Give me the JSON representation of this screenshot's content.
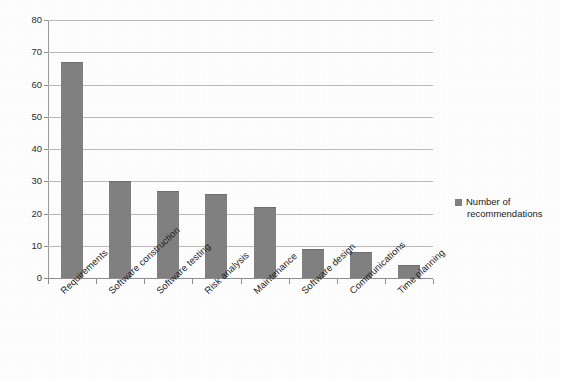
{
  "document": {
    "cut_off_header_text": "....... ... .. .. ......... .. ..... ......... ...."
  },
  "legend": {
    "marker_color": "#808080",
    "label_line1": "Number of",
    "label_line2": "recommendations"
  },
  "axes": {
    "y_ticks": [
      "80",
      "70",
      "60",
      "50",
      "40",
      "30",
      "20",
      "10",
      "0"
    ]
  },
  "chart_data": {
    "type": "bar",
    "title": "",
    "xlabel": "",
    "ylabel": "",
    "ylim": [
      0,
      80
    ],
    "ytick_step": 10,
    "grid": true,
    "legend_position": "right",
    "bar_color": "#808080",
    "categories": [
      "Requirements",
      "Software construction",
      "Software testing",
      "Risk analysis",
      "Maintenance",
      "Software design",
      "Communications",
      "Time planning"
    ],
    "series": [
      {
        "name": "Number of recommendations",
        "values": [
          67,
          30,
          27,
          26,
          22,
          9,
          8,
          4
        ]
      }
    ]
  }
}
